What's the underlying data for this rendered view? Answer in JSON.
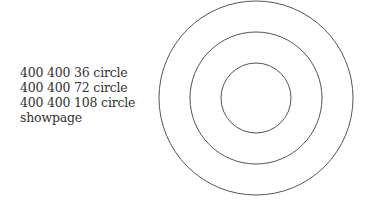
{
  "code_lines": [
    "400 400 36 circle",
    "400 400 72 circle",
    "400 400 108 circle",
    "showpage"
  ],
  "figure": {
    "stroke_color": "#555555",
    "center": [
      256,
      98
    ],
    "radii": [
      35,
      66,
      97
    ]
  }
}
